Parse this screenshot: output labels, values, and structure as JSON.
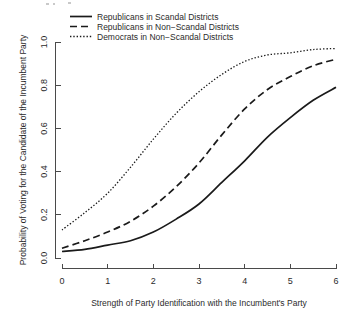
{
  "chart_data": {
    "type": "line",
    "title": "",
    "xlabel": "Strength of Party Identification with the Incumbent's Party",
    "ylabel": "Probability of Voting for the Candidate of the Incumbent Party",
    "xlim": [
      0,
      6
    ],
    "ylim": [
      0,
      1
    ],
    "xticks": [
      "0",
      "1",
      "2",
      "3",
      "4",
      "5",
      "6"
    ],
    "yticks": [
      "0.0",
      "0.2",
      "0.4",
      "0.6",
      "0.8",
      "1.0"
    ],
    "grid": false,
    "legend_position": "top-center",
    "x": [
      0,
      0.5,
      1,
      1.5,
      2,
      2.5,
      3,
      3.5,
      4,
      4.5,
      5,
      5.5,
      6
    ],
    "series": [
      {
        "name": "Republicans in Scandal Districts",
        "style": "solid",
        "color": "#1a1a1a",
        "values": [
          0.03,
          0.04,
          0.06,
          0.08,
          0.12,
          0.18,
          0.25,
          0.35,
          0.45,
          0.56,
          0.65,
          0.73,
          0.79
        ]
      },
      {
        "name": "Republicans in Non-Scandal Districts",
        "style": "dashed",
        "color": "#1a1a1a",
        "values": [
          0.045,
          0.08,
          0.12,
          0.17,
          0.24,
          0.33,
          0.44,
          0.57,
          0.69,
          0.78,
          0.84,
          0.89,
          0.92
        ]
      },
      {
        "name": "Democrats in Non-Scandal Districts",
        "style": "dotted",
        "color": "#1a1a1a",
        "values": [
          0.13,
          0.21,
          0.3,
          0.42,
          0.55,
          0.67,
          0.77,
          0.85,
          0.91,
          0.94,
          0.95,
          0.965,
          0.97
        ]
      }
    ]
  },
  "legend": {
    "entries": [
      {
        "label": "Republicans in Scandal Districts"
      },
      {
        "label": "Republicans in Non−Scandal Districts"
      },
      {
        "label": "Democrats in Non−Scandal Districts"
      }
    ]
  },
  "axes": {
    "x_title": "Strength of Party Identification with the Incumbent's Party",
    "y_title": "Probability of Voting for the Candidate of the Incumbent Party",
    "x_tick_labels": [
      "0",
      "1",
      "2",
      "3",
      "4",
      "5",
      "6"
    ],
    "y_tick_labels": [
      "0.0",
      "0.2",
      "0.4",
      "0.6",
      "0.8",
      "1.0"
    ]
  }
}
